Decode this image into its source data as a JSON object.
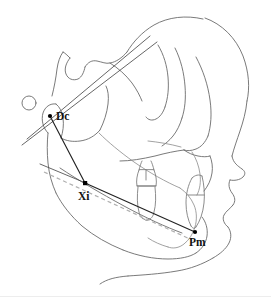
{
  "figure": {
    "background_color": "#ffffff",
    "width": 271,
    "height": 305,
    "trace_color": "#6b6b6b",
    "measure_line_color": "#222222",
    "dashed_line_color": "#b0b0b0",
    "landmark_color": "#000000",
    "divider_color": "#ededed"
  },
  "landmarks": [
    {
      "id": "dc",
      "label": "Dc",
      "point_x": 50,
      "point_y": 116,
      "label_x": 56,
      "label_y": 120,
      "description": "Dc - center of condyle neck on Ba-N plane"
    },
    {
      "id": "xi",
      "label": "Xi",
      "point_x": 85,
      "point_y": 183,
      "label_x": 78,
      "label_y": 200,
      "description": "Xi - geometric center of the ramus"
    },
    {
      "id": "pm",
      "label": "Pm",
      "point_x": 195,
      "point_y": 232,
      "label_x": 189,
      "label_y": 246,
      "description": "Pm - protuberance menti / suprapogonion"
    }
  ],
  "measurement_lines": [
    {
      "id": "dc-xi",
      "name": "condylar-axis",
      "from": "Dc",
      "to": "Xi",
      "x1": 50,
      "y1": 116,
      "x2": 85,
      "y2": 183
    },
    {
      "id": "xi-pm",
      "name": "corpus-axis",
      "from": "Xi",
      "to": "Pm",
      "x1": 85,
      "y1": 183,
      "x2": 195,
      "y2": 232
    }
  ],
  "reference_lines": [
    {
      "id": "corpus-axis-extended",
      "name": "corpus-axis-extension",
      "x1": 40,
      "y1": 164,
      "x2": 85,
      "y2": 183
    },
    {
      "id": "ba-n-plane",
      "name": "basion-nasion-plane",
      "x1": 22,
      "y1": 145,
      "x2": 157,
      "y2": 42
    },
    {
      "id": "cranial-base-line",
      "name": "cranial-base-reference",
      "x1": 25,
      "y1": 141,
      "x2": 148,
      "y2": 38
    }
  ],
  "dashed_reference": {
    "id": "occlusal-dashed",
    "name": "occlusal-plane-dashed",
    "x1": 42,
    "y1": 171,
    "x2": 192,
    "y2": 240
  },
  "annotations": {
    "small_circle": {
      "name": "porion-marker-circle",
      "cx": 29,
      "cy": 103,
      "r": 7
    }
  }
}
